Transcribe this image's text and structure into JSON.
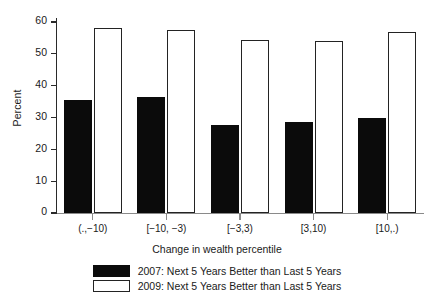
{
  "chart_data": {
    "type": "bar",
    "title": "",
    "subtitle": "",
    "xlabel": "Change in wealth percentile",
    "ylabel": "Percent",
    "categories": [
      "(.,−10)",
      "[−10, −3)",
      "[−3,3)",
      "[3,10)",
      "[10,.)"
    ],
    "series": [
      {
        "name": "2007: Next 5 Years Better than Last 5 Years",
        "color": "#0b0b0b",
        "fill": "solid",
        "values": [
          35.5,
          36.5,
          27.8,
          28.6,
          29.8
        ]
      },
      {
        "name": "2009: Next 5 Years Better than Last 5 Years",
        "color": "#ffffff",
        "fill": "outline",
        "values": [
          58.0,
          57.5,
          54.3,
          54.0,
          57.0
        ]
      }
    ],
    "ylim": [
      0,
      60
    ],
    "yticks": [
      0,
      10,
      20,
      30,
      40,
      50,
      60
    ],
    "ytick_labels": [
      "0",
      "10",
      "20",
      "30",
      "40",
      "50",
      "60"
    ],
    "grid": false,
    "legend_position": "bottom"
  },
  "axes": {
    "y_title": "Percent",
    "x_title": "Change in wealth percentile"
  },
  "legend": {
    "entries": [
      {
        "label": "2007: Next 5 Years Better than Last 5 Years"
      },
      {
        "label": "2009: Next 5 Years Better than Last 5 Years"
      }
    ]
  },
  "colors": {
    "series_2007": "#0b0b0b",
    "series_2009": "#ffffff",
    "axis": "#2a2a2a",
    "background": "#ffffff"
  }
}
